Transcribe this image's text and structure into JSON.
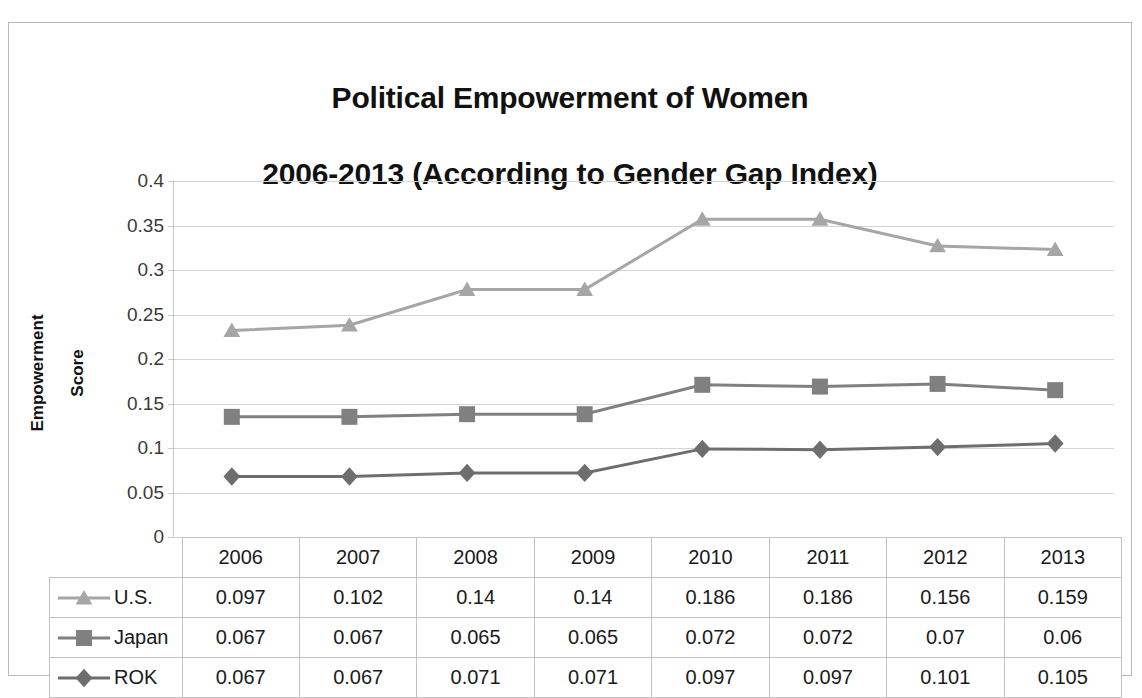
{
  "chart_data": {
    "type": "line",
    "title": "Political Empowerment of Women\n2006-2013 (According to Gender Gap Index)",
    "title_lines": [
      "Political Empowerment of Women",
      "2006-2013 (According to Gender Gap Index)"
    ],
    "xlabel": "",
    "ylabel": "Empowerment\nScore",
    "ylabel_lines": [
      "Empowerment",
      "Score"
    ],
    "categories": [
      "2006",
      "2007",
      "2008",
      "2009",
      "2010",
      "2011",
      "2012",
      "2013"
    ],
    "ylim": [
      0,
      0.4
    ],
    "ytick_labels": [
      "0.4",
      "0.35",
      "0.3",
      "0.25",
      "0.2",
      "0.15",
      "0.1",
      "0.05",
      "0"
    ],
    "ytick_values": [
      0.4,
      0.35,
      0.3,
      0.25,
      0.2,
      0.15,
      0.1,
      0.05,
      0
    ],
    "grid": true,
    "legend_position": "data-table-left",
    "series": [
      {
        "name": "U.S.",
        "marker": "triangle",
        "color": "#a6a6a6",
        "plotted_values": [
          0.232,
          0.238,
          0.278,
          0.278,
          0.357,
          0.357,
          0.327,
          0.323
        ],
        "table_values": [
          "0.097",
          "0.102",
          "0.14",
          "0.14",
          "0.186",
          "0.186",
          "0.156",
          "0.159"
        ]
      },
      {
        "name": "Japan",
        "marker": "square",
        "color": "#808080",
        "plotted_values": [
          0.135,
          0.135,
          0.138,
          0.138,
          0.171,
          0.169,
          0.172,
          0.165
        ],
        "table_values": [
          "0.067",
          "0.067",
          "0.065",
          "0.065",
          "0.072",
          "0.072",
          "0.07",
          "0.06"
        ]
      },
      {
        "name": "ROK",
        "marker": "diamond",
        "color": "#6e6e6e",
        "plotted_values": [
          0.068,
          0.068,
          0.072,
          0.072,
          0.099,
          0.098,
          0.101,
          0.105
        ],
        "table_values": [
          "0.067",
          "0.067",
          "0.071",
          "0.071",
          "0.097",
          "0.097",
          "0.101",
          "0.105"
        ]
      }
    ]
  },
  "colors": {
    "frame": "#b9b9b9",
    "gridline": "#d4d4d4",
    "table_border": "#c2c2c2",
    "text": "#1a1a1a"
  }
}
